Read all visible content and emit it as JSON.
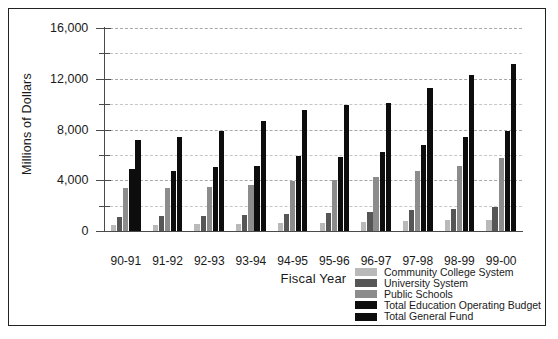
{
  "chart_data": {
    "type": "bar",
    "title": "",
    "xlabel": "Fiscal Year",
    "ylabel": "Millions of Dollars",
    "ylim": [
      0,
      16000
    ],
    "ytick_labels": [
      "0",
      "4,000",
      "8,000",
      "12,000",
      "16,000"
    ],
    "ytick_values": [
      0,
      4000,
      8000,
      12000,
      16000
    ],
    "yminor_values": [
      2000,
      6000,
      10000,
      14000
    ],
    "grid": true,
    "legend_position": "bottom-right",
    "categories": [
      "90-91",
      "91-92",
      "92-93",
      "93-94",
      "94-95",
      "95-96",
      "96-97",
      "97-98",
      "98-99",
      "99-00"
    ],
    "series": [
      {
        "name": "Community College System",
        "color": "#b9b9b9",
        "values": [
          480,
          490,
          520,
          560,
          620,
          660,
          700,
          760,
          840,
          900
        ]
      },
      {
        "name": "University System",
        "color": "#565656",
        "values": [
          1100,
          1150,
          1200,
          1280,
          1380,
          1420,
          1500,
          1620,
          1760,
          1900
        ]
      },
      {
        "name": "Public Schools",
        "color": "#8c8c8c",
        "values": [
          3360,
          3400,
          3480,
          3600,
          3920,
          4020,
          4280,
          4700,
          5120,
          5780
        ]
      },
      {
        "name": "Total Education Operating Budget",
        "color": "#0d0d0d",
        "values": [
          4900,
          4760,
          5020,
          5120,
          5920,
          5820,
          6200,
          6800,
          7400,
          7880
        ]
      },
      {
        "name": "Total General Fund",
        "color": "#0d0d0d",
        "values": [
          7200,
          7380,
          7920,
          8640,
          9560,
          9900,
          10120,
          11240,
          12280,
          13180
        ]
      }
    ]
  }
}
